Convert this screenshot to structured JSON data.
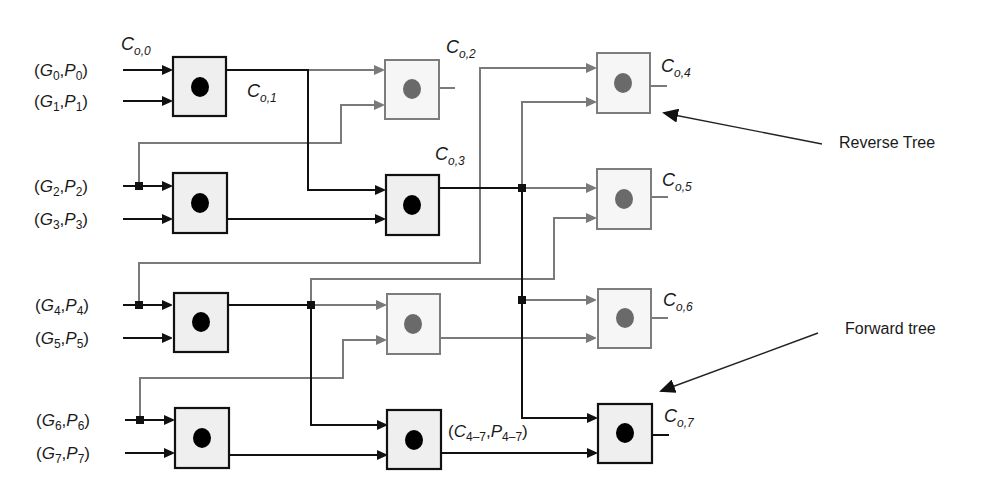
{
  "diagram": {
    "type": "parallel-prefix carry tree",
    "inputs": [
      {
        "G": "G",
        "P": "P",
        "index": "0"
      },
      {
        "G": "G",
        "P": "P",
        "index": "1"
      },
      {
        "G": "G",
        "P": "P",
        "index": "2"
      },
      {
        "G": "G",
        "P": "P",
        "index": "3"
      },
      {
        "G": "G",
        "P": "P",
        "index": "4"
      },
      {
        "G": "G",
        "P": "P",
        "index": "5"
      },
      {
        "G": "G",
        "P": "P",
        "index": "6"
      },
      {
        "G": "G",
        "P": "P",
        "index": "7"
      }
    ],
    "carry_labels": [
      {
        "base": "C",
        "sub": "o,0"
      },
      {
        "base": "C",
        "sub": "o,1"
      },
      {
        "base": "C",
        "sub": "o,2"
      },
      {
        "base": "C",
        "sub": "o,3"
      },
      {
        "base": "C",
        "sub": "o,4"
      },
      {
        "base": "C",
        "sub": "o,5"
      },
      {
        "base": "C",
        "sub": "o,6"
      },
      {
        "base": "C",
        "sub": "o,7"
      }
    ],
    "group_label": {
      "open": "(",
      "c": "C",
      "c_sub": "4–7",
      "sep": ",",
      "p": "P",
      "p_sub": "4–7",
      "close": ")"
    },
    "annotations": {
      "reverse_tree": "Reverse Tree",
      "forward_tree": "Forward tree"
    },
    "colors": {
      "forward": "#111111",
      "reverse": "#7a7a7a",
      "box_fill": "#efefef"
    }
  }
}
